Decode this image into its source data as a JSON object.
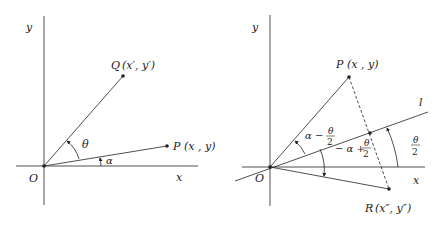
{
  "left_diagram": {
    "axis_x": "x",
    "axis_y": "y",
    "origin": "O",
    "point_q": "Q",
    "point_q_coords": "(x′, y′)",
    "point_p": "P",
    "point_p_coords": "(x , y)",
    "angle_theta": "θ",
    "angle_alpha": "α"
  },
  "right_diagram": {
    "axis_x": "x",
    "axis_y": "y",
    "origin": "O",
    "line_l": "l",
    "point_p": "P",
    "point_p_coords": "(x , y)",
    "point_r": "R",
    "point_r_coords": "(x″, y″)",
    "angle_upper_prefix": "α −",
    "angle_lower_prefix": "− α +",
    "angle_frac_num": "θ",
    "angle_frac_den": "2"
  },
  "colors": {
    "line": "#222222",
    "background": "#ffffff"
  }
}
